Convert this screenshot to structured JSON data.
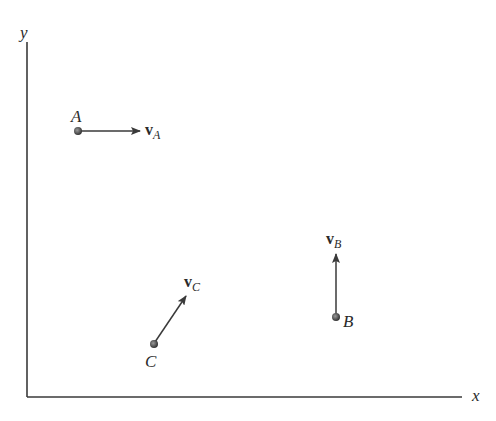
{
  "diagram": {
    "axes": {
      "x_label": "x",
      "y_label": "y",
      "origin": [
        27,
        397
      ],
      "x_end": [
        462,
        397
      ],
      "y_end": [
        27,
        42
      ]
    },
    "points": [
      {
        "id": "A",
        "label": "A",
        "pos": [
          78,
          131
        ],
        "velocity_label": "v",
        "velocity_sub": "A",
        "direction": "right"
      },
      {
        "id": "B",
        "label": "B",
        "pos": [
          336,
          317
        ],
        "velocity_label": "v",
        "velocity_sub": "B",
        "direction": "up"
      },
      {
        "id": "C",
        "label": "C",
        "pos": [
          154,
          344
        ],
        "velocity_label": "v",
        "velocity_sub": "C",
        "direction": "up-right"
      }
    ],
    "colors": {
      "line": "#3a3a3a",
      "dot": "#4a4a4a"
    }
  }
}
